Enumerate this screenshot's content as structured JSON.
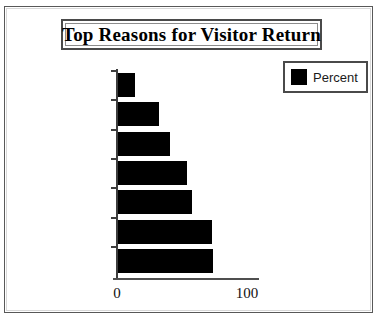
{
  "chart": {
    "title": "Top Reasons for Visitor Return",
    "legend": {
      "entries": [
        {
          "label": "Percent",
          "color": "#000000",
          "swatch_icon": "filled-square-icon"
        }
      ],
      "position": "top-right"
    }
  },
  "chart_data": {
    "type": "bar",
    "orientation": "horizontal",
    "title": "Top Reasons for Visitor Return",
    "xlabel": "",
    "ylabel": "",
    "xlim": [
      0,
      100
    ],
    "xticks": [
      0,
      100
    ],
    "xtick_labels": [
      "0",
      "100"
    ],
    "grid": false,
    "legend_position": "top-right",
    "categories": [
      "Building",
      "Child Care",
      "Meaning",
      "Sunday School",
      "Worship",
      "Friend",
      "Warmth"
    ],
    "series": [
      {
        "name": "Percent",
        "color": "#000000",
        "values": [
          14,
          32,
          41,
          54,
          58,
          73,
          74
        ]
      }
    ]
  }
}
